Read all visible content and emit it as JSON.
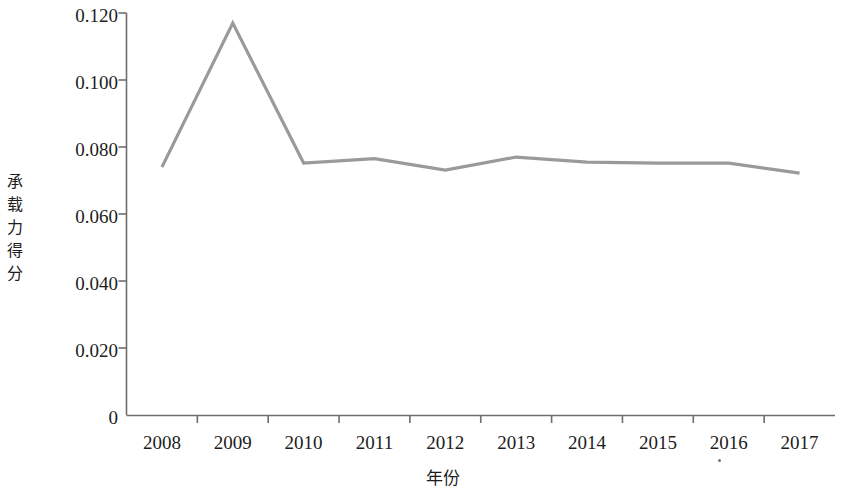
{
  "chart_data": {
    "type": "line",
    "title": "",
    "xlabel": "年份",
    "ylabel": "承载力得分",
    "categories": [
      "2008",
      "2009",
      "2010",
      "2011",
      "2012",
      "2013",
      "2014",
      "2015",
      "2016",
      "2017"
    ],
    "values": [
      0.074,
      0.117,
      0.0752,
      0.0765,
      0.0731,
      0.077,
      0.0755,
      0.0752,
      0.0752,
      0.0722
    ],
    "series": [
      {
        "name": "承载力得分",
        "values": [
          0.074,
          0.117,
          0.0752,
          0.0765,
          0.0731,
          0.077,
          0.0755,
          0.0752,
          0.0752,
          0.0722
        ]
      }
    ],
    "ylim": [
      0,
      0.12
    ],
    "y_ticks": [
      0.12,
      0.1,
      0.08,
      0.06,
      0.04,
      0.02,
      0
    ],
    "y_tick_labels": [
      "0.120",
      "0.100",
      "0.080",
      "0.060",
      "0.040",
      "0.020",
      "0"
    ],
    "grid": false,
    "legend": false,
    "legend_position": "none",
    "line_color": "#9a9a9a",
    "axis_color": "#666666",
    "markers": false
  },
  "axes": {
    "y_title_chars": [
      "承",
      "载",
      "力",
      "得",
      "分"
    ],
    "x_title": "年份"
  }
}
